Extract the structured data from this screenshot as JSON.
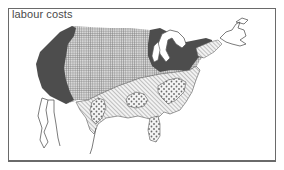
{
  "map": {
    "title": "labour costs",
    "colors": {
      "frame": "#6a6a6a",
      "high": "#4d4d4d",
      "grid": "#7a7a7a",
      "hatch": "#8a8a8a",
      "dots": "#6a6a6a",
      "outline": "#5a5a5a",
      "background": "#ffffff"
    },
    "regions": [
      {
        "id": "west-coast",
        "pattern": "solid-dark"
      },
      {
        "id": "northeast-great-lakes",
        "pattern": "solid-dark"
      },
      {
        "id": "interior",
        "pattern": "grid"
      },
      {
        "id": "south",
        "pattern": "diagonal-hatch"
      },
      {
        "id": "southeast-low",
        "pattern": "dots"
      },
      {
        "id": "mexico-outline",
        "pattern": "none"
      }
    ]
  }
}
